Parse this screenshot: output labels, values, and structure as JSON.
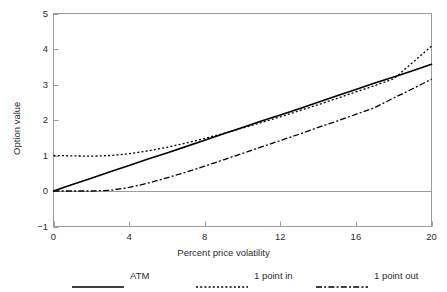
{
  "chart_data": {
    "type": "line",
    "title": "",
    "xlabel": "Percent price volatility",
    "ylabel": "Option value",
    "xlim": [
      0,
      20
    ],
    "ylim": [
      -1,
      5
    ],
    "xticks": [
      0,
      4,
      8,
      12,
      16,
      20
    ],
    "yticks": [
      -1,
      0,
      1,
      2,
      3,
      4,
      5
    ],
    "xtick_labels": [
      "0",
      "4",
      "8",
      "12",
      "16",
      "20"
    ],
    "ytick_labels": [
      "−1",
      "0",
      "1",
      "2",
      "3",
      "4",
      "5"
    ],
    "grid": false,
    "zero_line": true,
    "legend_position": "bottom",
    "x": [
      0,
      1,
      2,
      3,
      4,
      5,
      6,
      7,
      8,
      9,
      10,
      11,
      12,
      13,
      14,
      15,
      16,
      17,
      18,
      19,
      20
    ],
    "series": [
      {
        "name": "ATM",
        "style": "solid",
        "color": "#000000",
        "values": [
          0.0,
          0.18,
          0.36,
          0.54,
          0.72,
          0.9,
          1.07,
          1.25,
          1.43,
          1.61,
          1.79,
          1.97,
          2.14,
          2.32,
          2.5,
          2.68,
          2.86,
          3.04,
          3.21,
          3.39,
          3.57
        ]
      },
      {
        "name": "1 point in",
        "style": "dotted",
        "color": "#000000",
        "values": [
          1.0,
          0.99,
          0.98,
          1.0,
          1.05,
          1.13,
          1.23,
          1.35,
          1.48,
          1.62,
          1.77,
          1.93,
          2.09,
          2.26,
          2.43,
          2.61,
          2.79,
          2.97,
          3.16,
          3.62,
          4.08
        ]
      },
      {
        "name": "1 point out",
        "style": "dashdot",
        "color": "#000000",
        "values": [
          0.0,
          0.0,
          0.0,
          0.02,
          0.1,
          0.22,
          0.37,
          0.53,
          0.7,
          0.88,
          1.06,
          1.24,
          1.42,
          1.6,
          1.79,
          1.97,
          2.16,
          2.35,
          2.62,
          2.88,
          3.15
        ]
      }
    ]
  },
  "legend": {
    "entries": [
      {
        "label": "ATM",
        "style": "solid"
      },
      {
        "label": "1 point in",
        "style": "dotted"
      },
      {
        "label": "1 point out",
        "style": "dashdot"
      }
    ]
  },
  "axes": {
    "frame_color": "#9a9a9a",
    "zero_line_color": "#9a9a9a",
    "tick_color": "#9a9a9a"
  }
}
